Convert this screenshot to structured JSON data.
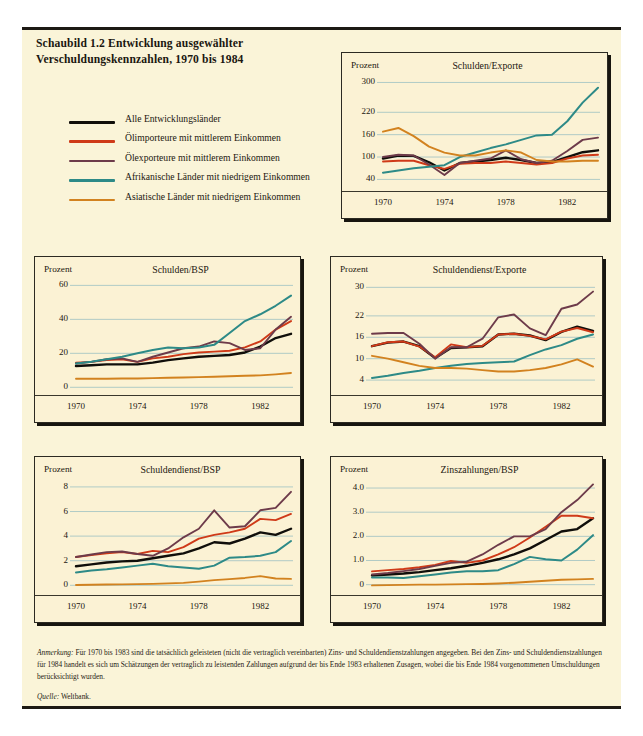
{
  "figure": {
    "title_line1": "Schaubild 1.2   Entwicklung ausgewählter",
    "title_line2": "Verschuldungskennzahlen, 1970 bis 1984",
    "note_label": "Anmerkung:",
    "note_text": " Für 1970 bis 1983 sind die tatsächlich geleisteten (nicht die vertraglich vereinbarten) Zins- und Schuldendienstzahlungen angegeben. Bei den Zins- und Schuldendienstzahlungen für 1984 handelt es sich um Schätzungen der vertraglich zu leistenden Zahlungen aufgrund der bis Ende 1983 erhaltenen Zusagen, wobei die bis Ende 1984 vorgenommenen Umschuldungen berücksichtigt wurden.",
    "source_label": "Quelle:",
    "source_text": " Weltbank."
  },
  "legend": {
    "items": [
      {
        "label": "Alle Entwicklungsländer",
        "color": "#100e0a"
      },
      {
        "label": "Ölimporteure mit mittlerem Einkommen",
        "color": "#cf3a18"
      },
      {
        "label": "Ölexporteure mit mittlerem Einkommen",
        "color": "#6d3b4a"
      },
      {
        "label": "Afrikanische Länder mit niedrigem Einkommen",
        "color": "#2d8a87"
      },
      {
        "label": "Asiatische Länder mit niedrigem Einkommen",
        "color": "#d2821f"
      }
    ]
  },
  "chart_data": [
    {
      "id": "schulden-exporte",
      "type": "line",
      "title": "Schulden/Exporte",
      "ylabel": "Prozent",
      "xlabel": "",
      "x": [
        1970,
        1971,
        1972,
        1973,
        1974,
        1975,
        1976,
        1977,
        1978,
        1979,
        1980,
        1981,
        1982,
        1983,
        1984
      ],
      "xticks": [
        1970,
        1974,
        1978,
        1982
      ],
      "yticks": [
        40,
        100,
        160,
        220,
        300
      ],
      "ylim": [
        25,
        312
      ],
      "xlim": [
        1970,
        1984
      ],
      "grid": true,
      "series": [
        {
          "name": "Alle Entwicklungsländer",
          "color": "#100e0a",
          "width": 2.4,
          "values": [
            96,
            104,
            103,
            86,
            64,
            84,
            88,
            92,
            98,
            92,
            84,
            86,
            100,
            113,
            118
          ]
        },
        {
          "name": "Ölimporteure mit mittlerem Einkommen",
          "color": "#cf3a18",
          "width": 1.9,
          "values": [
            88,
            90,
            90,
            78,
            68,
            82,
            84,
            84,
            88,
            84,
            80,
            84,
            96,
            104,
            106
          ]
        },
        {
          "name": "Ölexporteure mit mittlerem Einkommen",
          "color": "#6d3b4a",
          "width": 1.9,
          "values": [
            100,
            106,
            104,
            80,
            52,
            84,
            90,
            96,
            118,
            94,
            84,
            90,
            116,
            146,
            152
          ]
        },
        {
          "name": "Afrikanische Länder mit niedrigem Einkommen",
          "color": "#2d8a87",
          "width": 2.0,
          "values": [
            58,
            64,
            70,
            74,
            78,
            100,
            112,
            124,
            134,
            146,
            158,
            160,
            196,
            246,
            286
          ]
        },
        {
          "name": "Asiatische Länder mit niedrigem Einkommen",
          "color": "#d2821f",
          "width": 1.9,
          "values": [
            168,
            178,
            156,
            128,
            112,
            104,
            104,
            112,
            118,
            112,
            92,
            88,
            88,
            90,
            90
          ]
        }
      ]
    },
    {
      "id": "schulden-bsp",
      "type": "line",
      "title": "Schulden/BSP",
      "ylabel": "Prozent",
      "xlabel": "",
      "x": [
        1970,
        1971,
        1972,
        1973,
        1974,
        1975,
        1976,
        1977,
        1978,
        1979,
        1980,
        1981,
        1982,
        1983,
        1984
      ],
      "xticks": [
        1970,
        1974,
        1978,
        1982
      ],
      "yticks": [
        0,
        20,
        40,
        60
      ],
      "ylim": [
        -1,
        62
      ],
      "xlim": [
        1970,
        1984
      ],
      "grid": true,
      "series": [
        {
          "name": "Alle Entwicklungsländer",
          "color": "#100e0a",
          "width": 2.4,
          "values": [
            12.5,
            13,
            13.5,
            13.5,
            13.5,
            14.5,
            16,
            17,
            18,
            18.5,
            19,
            20.5,
            24,
            29,
            31.5
          ]
        },
        {
          "name": "Ölimporteure mit mittlerem Einkommen",
          "color": "#cf3a18",
          "width": 1.9,
          "values": [
            14.5,
            15,
            16,
            16.5,
            15,
            17,
            18,
            19.5,
            20.5,
            21,
            21.5,
            23.5,
            27,
            34,
            39
          ]
        },
        {
          "name": "Ölexporteure mit mittlerem Einkommen",
          "color": "#6d3b4a",
          "width": 1.9,
          "values": [
            14,
            15,
            16.5,
            17,
            15,
            18,
            20.5,
            23,
            24,
            27,
            26,
            22,
            23,
            34,
            41.5
          ]
        },
        {
          "name": "Afrikanische Länder mit niedrigem Einkommen",
          "color": "#2d8a87",
          "width": 2.0,
          "values": [
            14,
            15,
            16.5,
            18,
            20,
            22,
            23.5,
            23,
            23.5,
            25,
            32,
            39,
            43,
            48,
            54
          ]
        },
        {
          "name": "Asiatische Länder mit niedrigem Einkommen",
          "color": "#d2821f",
          "width": 1.9,
          "values": [
            5,
            5,
            5,
            5.2,
            5.2,
            5.4,
            5.6,
            5.8,
            6,
            6.2,
            6.5,
            6.8,
            7,
            7.6,
            8.4
          ]
        }
      ]
    },
    {
      "id": "schuldendienst-exporte",
      "type": "line",
      "title": "Schuldendienst/Exporte",
      "ylabel": "Prozent",
      "xlabel": "",
      "x": [
        1970,
        1971,
        1972,
        1973,
        1974,
        1975,
        1976,
        1977,
        1978,
        1979,
        1980,
        1981,
        1982,
        1983,
        1984
      ],
      "xticks": [
        1970,
        1974,
        1978,
        1982
      ],
      "yticks": [
        4,
        10,
        16,
        22,
        30
      ],
      "ylim": [
        1.5,
        31.5
      ],
      "xlim": [
        1970,
        1984
      ],
      "grid": true,
      "series": [
        {
          "name": "Alle Entwicklungsländer",
          "color": "#100e0a",
          "width": 2.4,
          "values": [
            13.5,
            14.5,
            14.8,
            13.5,
            10.2,
            13,
            13.2,
            13.5,
            16.8,
            17,
            16.5,
            15.2,
            17.5,
            19,
            17.8
          ]
        },
        {
          "name": "Ölimporteure mit mittlerem Einkommen",
          "color": "#cf3a18",
          "width": 1.9,
          "values": [
            13.5,
            14.6,
            14.8,
            13.4,
            10.4,
            14,
            13.2,
            13.6,
            16.8,
            17,
            16.4,
            15.4,
            17.6,
            18.6,
            17.4
          ]
        },
        {
          "name": "Ölexporteure mit mittlerem Einkommen",
          "color": "#6d3b4a",
          "width": 1.9,
          "values": [
            17,
            17.2,
            17.2,
            14.2,
            10,
            13.2,
            13.2,
            15.6,
            21.6,
            22.4,
            18.5,
            16.6,
            24,
            25.2,
            28.8
          ]
        },
        {
          "name": "Afrikanische Länder mit niedrigem Einkommen",
          "color": "#2d8a87",
          "width": 2.0,
          "values": [
            4.6,
            5.2,
            6,
            6.6,
            7.4,
            8,
            8.5,
            8.8,
            9,
            9.2,
            11,
            12.6,
            13.8,
            15.6,
            16.8,
            16.8
          ]
        },
        {
          "name": "Asiatische Länder mit niedrigem Einkommen",
          "color": "#d2821f",
          "width": 1.9,
          "values": [
            10.8,
            10,
            9,
            8,
            7.4,
            7.4,
            7.2,
            6.8,
            6.4,
            6.4,
            6.8,
            7.4,
            8.4,
            9.8,
            7.8
          ]
        }
      ]
    },
    {
      "id": "schuldendienst-bsp",
      "type": "line",
      "title": "Schuldendienst/BSP",
      "ylabel": "Prozent",
      "xlabel": "",
      "x": [
        1970,
        1971,
        1972,
        1973,
        1974,
        1975,
        1976,
        1977,
        1978,
        1979,
        1980,
        1981,
        1982,
        1983,
        1984
      ],
      "xticks": [
        1970,
        1974,
        1978,
        1982
      ],
      "yticks": [
        0,
        2,
        4,
        6,
        8
      ],
      "ylim": [
        -0.3,
        8.4
      ],
      "xlim": [
        1970,
        1984
      ],
      "grid": true,
      "series": [
        {
          "name": "Alle Entwicklungsländer",
          "color": "#100e0a",
          "width": 2.4,
          "values": [
            1.55,
            1.7,
            1.85,
            1.95,
            2.0,
            2.2,
            2.4,
            2.6,
            3.0,
            3.5,
            3.4,
            3.8,
            4.3,
            4.1,
            4.6
          ]
        },
        {
          "name": "Ölimporteure mit mittlerem Einkommen",
          "color": "#cf3a18",
          "width": 1.9,
          "values": [
            2.3,
            2.45,
            2.6,
            2.7,
            2.55,
            2.8,
            2.7,
            3.1,
            3.8,
            4.1,
            4.3,
            4.6,
            5.4,
            5.3,
            5.8
          ]
        },
        {
          "name": "Ölexporteure mit mittlerem Einkommen",
          "color": "#6d3b4a",
          "width": 1.9,
          "values": [
            2.3,
            2.5,
            2.7,
            2.75,
            2.55,
            2.4,
            3.0,
            3.9,
            4.6,
            6.1,
            4.7,
            4.8,
            6.1,
            6.3,
            7.6
          ]
        },
        {
          "name": "Afrikanische Länder mit niedrigem Einkommen",
          "color": "#2d8a87",
          "width": 2.0,
          "values": [
            1.05,
            1.2,
            1.3,
            1.45,
            1.6,
            1.75,
            1.55,
            1.45,
            1.35,
            1.6,
            2.25,
            2.3,
            2.4,
            2.7,
            3.6
          ]
        },
        {
          "name": "Asiatische Länder mit niedrigem Einkommen",
          "color": "#d2821f",
          "width": 1.9,
          "values": [
            0.02,
            0.04,
            0.06,
            0.08,
            0.1,
            0.12,
            0.16,
            0.2,
            0.3,
            0.42,
            0.5,
            0.6,
            0.75,
            0.55,
            0.52
          ]
        }
      ]
    },
    {
      "id": "zinszahlungen-bsp",
      "type": "line",
      "title": "Zinszahlungen/BSP",
      "ylabel": "Prozent",
      "xlabel": "",
      "x": [
        1970,
        1971,
        1972,
        1973,
        1974,
        1975,
        1976,
        1977,
        1978,
        1979,
        1980,
        1981,
        1982,
        1983,
        1984
      ],
      "xticks": [
        1970,
        1974,
        1978,
        1982
      ],
      "yticks": [
        0,
        1.0,
        2.0,
        3.0,
        4.0
      ],
      "ylim": [
        -0.18,
        4.25
      ],
      "xlim": [
        1970,
        1984
      ],
      "grid": true,
      "series": [
        {
          "name": "Alle Entwicklungsländer",
          "color": "#100e0a",
          "width": 2.4,
          "values": [
            0.38,
            0.42,
            0.46,
            0.52,
            0.6,
            0.68,
            0.78,
            0.9,
            1.05,
            1.25,
            1.5,
            1.85,
            2.2,
            2.3,
            2.75
          ]
        },
        {
          "name": "Ölimporteure mit mittlerem Einkommen",
          "color": "#cf3a18",
          "width": 1.9,
          "values": [
            0.55,
            0.6,
            0.65,
            0.72,
            0.82,
            0.98,
            0.9,
            1.0,
            1.25,
            1.55,
            1.95,
            2.4,
            2.85,
            2.85,
            2.75
          ]
        },
        {
          "name": "Ölexporteure mit mittlerem Einkommen",
          "color": "#6d3b4a",
          "width": 1.9,
          "values": [
            0.42,
            0.48,
            0.56,
            0.65,
            0.78,
            0.9,
            0.95,
            1.25,
            1.65,
            2.0,
            2.0,
            2.3,
            3.0,
            3.5,
            4.15
          ]
        },
        {
          "name": "Afrikanische Länder mit niedrigem Einkommen",
          "color": "#2d8a87",
          "width": 2.0,
          "values": [
            0.3,
            0.3,
            0.28,
            0.35,
            0.42,
            0.5,
            0.55,
            0.55,
            0.6,
            0.85,
            1.15,
            1.05,
            1.0,
            1.45,
            2.05
          ]
        },
        {
          "name": "Asiatische Länder mit niedrigem Einkommen",
          "color": "#d2821f",
          "width": 1.9,
          "values": [
            -0.03,
            -0.02,
            -0.01,
            0.0,
            0.0,
            0.01,
            0.02,
            0.03,
            0.05,
            0.08,
            0.12,
            0.16,
            0.2,
            0.22,
            0.24
          ]
        }
      ]
    }
  ]
}
